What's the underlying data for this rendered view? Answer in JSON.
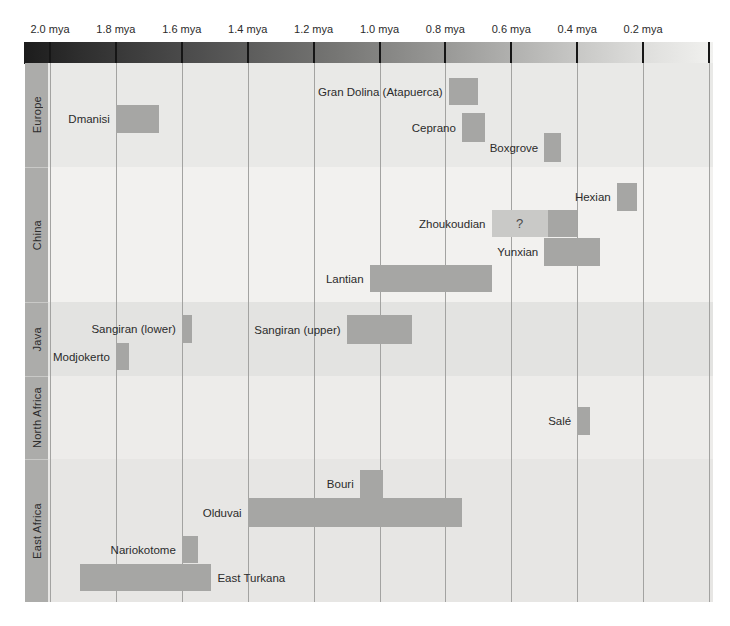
{
  "axis": {
    "ticks": [
      "2.0 mya",
      "1.8 mya",
      "1.6 mya",
      "1.4 mya",
      "1.2 mya",
      "1.0 mya",
      "0.8 mya",
      "0.6 mya",
      "0.4 mya",
      "0.2 mya"
    ],
    "tick_values_mya": [
      2.0,
      1.8,
      1.6,
      1.4,
      1.2,
      1.0,
      0.8,
      0.6,
      0.4,
      0.2
    ],
    "range_mya": [
      2.0,
      0.0
    ],
    "direction": "older time on the left"
  },
  "colors": {
    "bar": "#a6a6a4",
    "bar_uncertain": "#c9c9c7",
    "sidebar": "#acacaa",
    "gridline": "#a3a3a1",
    "text": "#2b2b2b",
    "gradient_dark_end": "#1c1c1c",
    "gradient_light_end": "#f1f1ef",
    "band_europe": "#e9e9e7",
    "band_china": "#f2f1ef",
    "band_java": "#e3e3e1",
    "band_north_africa": "#edecea",
    "band_east_africa": "#e7e6e4"
  },
  "regions": [
    {
      "name": "Europe",
      "band_top": 63,
      "band_bottom": 167,
      "bg": "#e9e9e7",
      "sites": [
        {
          "name": "Gran Dolina (Atapuerca)",
          "start_mya": 0.79,
          "end_mya": 0.7,
          "y_px": 78,
          "h_px": 27,
          "label_side": "left"
        },
        {
          "name": "Dmanisi",
          "start_mya": 1.8,
          "end_mya": 1.67,
          "y_px": 105,
          "h_px": 28,
          "label_side": "left"
        },
        {
          "name": "Ceprano",
          "start_mya": 0.75,
          "end_mya": 0.68,
          "y_px": 113,
          "h_px": 29,
          "label_side": "left"
        },
        {
          "name": "Boxgrove",
          "start_mya": 0.5,
          "end_mya": 0.45,
          "y_px": 133,
          "h_px": 29,
          "label_side": "left"
        }
      ]
    },
    {
      "name": "China",
      "band_top": 167,
      "band_bottom": 302,
      "bg": "#f2f1ef",
      "sites": [
        {
          "name": "Hexian",
          "start_mya": 0.28,
          "end_mya": 0.22,
          "y_px": 183,
          "h_px": 28,
          "label_side": "left"
        },
        {
          "name": "Zhoukoudian",
          "start_mya": 0.66,
          "end_mya": 0.4,
          "uncertain_until_mya": 0.49,
          "uncertain_label": "?",
          "y_px": 210,
          "h_px": 27,
          "label_side": "left"
        },
        {
          "name": "Yunxian",
          "start_mya": 0.5,
          "end_mya": 0.33,
          "y_px": 238,
          "h_px": 28,
          "label_side": "left"
        },
        {
          "name": "Lantian",
          "start_mya": 1.03,
          "end_mya": 0.66,
          "y_px": 265,
          "h_px": 27,
          "label_side": "left"
        }
      ]
    },
    {
      "name": "Java",
      "band_top": 302,
      "band_bottom": 376,
      "bg": "#e3e3e1",
      "sites": [
        {
          "name": "Sangiran (lower)",
          "start_mya": 1.6,
          "end_mya": 1.57,
          "y_px": 315,
          "h_px": 28,
          "label_side": "left"
        },
        {
          "name": "Sangiran (upper)",
          "start_mya": 1.1,
          "end_mya": 0.9,
          "y_px": 315,
          "h_px": 29,
          "label_side": "left"
        },
        {
          "name": "Modjokerto",
          "start_mya": 1.8,
          "end_mya": 1.76,
          "y_px": 343,
          "h_px": 27,
          "label_side": "left"
        }
      ]
    },
    {
      "name": "North Africa",
      "band_top": 376,
      "band_bottom": 459,
      "bg": "#edecea",
      "sites": [
        {
          "name": "Salé",
          "start_mya": 0.4,
          "end_mya": 0.36,
          "y_px": 407,
          "h_px": 28,
          "label_side": "left"
        }
      ]
    },
    {
      "name": "East Africa",
      "band_top": 459,
      "band_bottom": 602,
      "bg": "#e7e6e4",
      "sites": [
        {
          "name": "Bouri",
          "start_mya": 1.06,
          "end_mya": 0.99,
          "y_px": 470,
          "h_px": 28,
          "label_side": "left"
        },
        {
          "name": "Olduvai",
          "start_mya": 1.4,
          "end_mya": 0.75,
          "y_px": 498,
          "h_px": 29,
          "label_side": "left"
        },
        {
          "name": "Nariokotome",
          "start_mya": 1.6,
          "end_mya": 1.55,
          "y_px": 536,
          "h_px": 27,
          "label_side": "left"
        },
        {
          "name": "East Turkana",
          "start_mya": 1.91,
          "end_mya": 1.51,
          "y_px": 564,
          "h_px": 27,
          "label_side": "right"
        }
      ]
    }
  ],
  "chart_data": {
    "type": "bar",
    "subtype": "horizontal-time-range-timeline",
    "title": "",
    "xlabel": "mya (millions of years ago)",
    "x_ticks_mya": [
      2.0,
      1.8,
      1.6,
      1.4,
      1.2,
      1.0,
      0.8,
      0.6,
      0.4,
      0.2
    ],
    "x_range_mya": [
      2.0,
      0.0
    ],
    "x_direction": "older-left",
    "grid": "vertical gridlines every 0.2 mya",
    "legend": "none",
    "series": [
      {
        "region": "Europe",
        "sites": [
          {
            "name": "Dmanisi",
            "range_mya": [
              1.8,
              1.67
            ]
          },
          {
            "name": "Gran Dolina (Atapuerca)",
            "range_mya": [
              0.79,
              0.7
            ]
          },
          {
            "name": "Ceprano",
            "range_mya": [
              0.75,
              0.68
            ]
          },
          {
            "name": "Boxgrove",
            "range_mya": [
              0.5,
              0.45
            ]
          }
        ]
      },
      {
        "region": "China",
        "sites": [
          {
            "name": "Hexian",
            "range_mya": [
              0.28,
              0.22
            ]
          },
          {
            "name": "Zhoukoudian",
            "range_mya": [
              0.66,
              0.4
            ],
            "uncertain_range_mya": [
              0.66,
              0.49
            ],
            "annotation": "?"
          },
          {
            "name": "Yunxian",
            "range_mya": [
              0.5,
              0.33
            ]
          },
          {
            "name": "Lantian",
            "range_mya": [
              1.03,
              0.66
            ]
          }
        ]
      },
      {
        "region": "Java",
        "sites": [
          {
            "name": "Sangiran (lower)",
            "range_mya": [
              1.6,
              1.57
            ]
          },
          {
            "name": "Sangiran (upper)",
            "range_mya": [
              1.1,
              0.9
            ]
          },
          {
            "name": "Modjokerto",
            "range_mya": [
              1.8,
              1.76
            ]
          }
        ]
      },
      {
        "region": "North Africa",
        "sites": [
          {
            "name": "Salé",
            "range_mya": [
              0.4,
              0.36
            ]
          }
        ]
      },
      {
        "region": "East Africa",
        "sites": [
          {
            "name": "Bouri",
            "range_mya": [
              1.06,
              0.99
            ]
          },
          {
            "name": "Olduvai",
            "range_mya": [
              1.4,
              0.75
            ]
          },
          {
            "name": "Nariokotome",
            "range_mya": [
              1.6,
              1.55
            ]
          },
          {
            "name": "East Turkana",
            "range_mya": [
              1.91,
              1.51
            ]
          }
        ]
      }
    ]
  }
}
